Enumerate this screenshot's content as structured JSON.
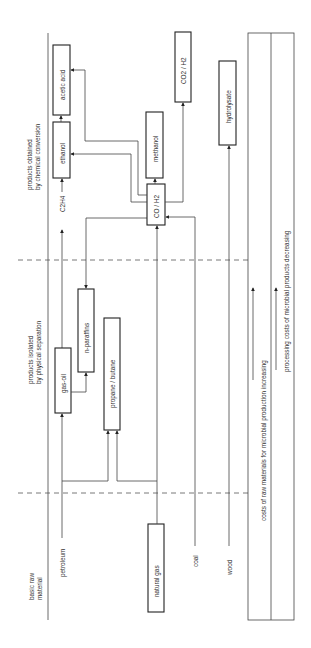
{
  "diagram": {
    "orientation": "rotated-90-ccw",
    "columns": {
      "raw": "basic raw material",
      "physical_1": "products isolated",
      "physical_2": "by physical separation",
      "chemical_1": "products obtained",
      "chemical_2": "by chemical conversion"
    },
    "raw_label_1": "basic raw",
    "raw_label_2": "material",
    "raw_materials": {
      "petroleum": "petroleum",
      "natural_gas": "natural gas",
      "coal": "coal",
      "wood": "wood"
    },
    "physical_products": {
      "gas_oil": "gas-oil",
      "n_paraffins": "n-paraffins",
      "propane_butane": "propane / butane"
    },
    "chemical_products": {
      "c2h4": "C2H4",
      "co_h2": "CO / H2",
      "ethanol": "ethanol",
      "acetic_acid": "acetic acid",
      "methanol": "methanol",
      "co2_h2": "CO2 / H2",
      "hydrolysate": "hydrolysate"
    },
    "cost_trends": {
      "raw_costs": "costs of raw materials for microbial production increasing",
      "processing_costs": "processing costs of microbial products decreasing"
    }
  }
}
